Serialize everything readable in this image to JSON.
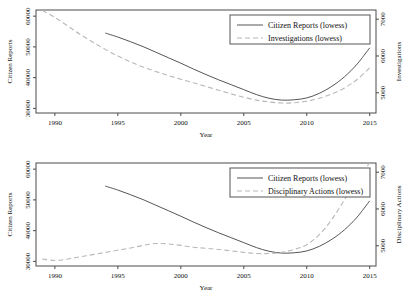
{
  "figure": {
    "background": "#ffffff",
    "solid_color": "#555555",
    "dashed_color": "#b8b8b8",
    "frame_color": "#4a4a4a"
  },
  "chart_data": [
    {
      "type": "line",
      "title": "",
      "panel": "top",
      "xlabel": "Year",
      "ylabel": "Citizen Reports",
      "y2label": "Investigations",
      "xlim": [
        1988.5,
        2015.5
      ],
      "ylim": [
        28500,
        62000
      ],
      "y2lim": [
        4450,
        7250
      ],
      "xticks": [
        1990,
        1995,
        2000,
        2005,
        2010,
        2015
      ],
      "yticks": [
        30000,
        40000,
        50000,
        60000
      ],
      "y2ticks": [
        5000,
        6000,
        7000
      ],
      "grid": false,
      "legend_position": "top-right",
      "series": [
        {
          "name": "Citizen Reports (lowess)",
          "style": "solid",
          "axis": "left",
          "x": [
            1994,
            1995,
            1996,
            1997,
            1998,
            1999,
            2000,
            2001,
            2002,
            2003,
            2004,
            2005,
            2006,
            2007,
            2008,
            2009,
            2010,
            2011,
            2012,
            2013,
            2014,
            2015
          ],
          "values": [
            54500,
            53200,
            51700,
            50100,
            48300,
            46500,
            44700,
            42800,
            41000,
            39300,
            37700,
            36100,
            34500,
            33300,
            32700,
            32800,
            33400,
            34900,
            37200,
            40300,
            44400,
            49700
          ]
        },
        {
          "name": "Investigations (lowess)",
          "style": "dashed",
          "axis": "right",
          "x": [
            1989,
            1990,
            1991,
            1992,
            1993,
            1994,
            1995,
            1996,
            1997,
            1998,
            1999,
            2000,
            2001,
            2002,
            2003,
            2004,
            2005,
            2006,
            2007,
            2008,
            2009,
            2010,
            2011,
            2012,
            2013,
            2014,
            2015
          ],
          "values": [
            7240,
            7050,
            6820,
            6590,
            6380,
            6180,
            6000,
            5840,
            5700,
            5580,
            5470,
            5370,
            5270,
            5170,
            5070,
            4970,
            4880,
            4800,
            4750,
            4720,
            4730,
            4770,
            4850,
            4970,
            5130,
            5360,
            5680
          ]
        }
      ]
    },
    {
      "type": "line",
      "title": "",
      "panel": "bottom",
      "xlabel": "Year",
      "ylabel": "Citizen Reports",
      "y2label": "Disciplinary Actions",
      "xlim": [
        1988.5,
        2015.5
      ],
      "ylim": [
        28500,
        62000
      ],
      "y2lim": [
        4450,
        7250
      ],
      "xticks": [
        1990,
        1995,
        2000,
        2005,
        2010,
        2015
      ],
      "yticks": [
        30000,
        40000,
        50000,
        60000
      ],
      "y2ticks": [
        5000,
        6000,
        7000
      ],
      "grid": false,
      "legend_position": "top-right",
      "series": [
        {
          "name": "Citizen Reports (lowess)",
          "style": "solid",
          "axis": "left",
          "x": [
            1994,
            1995,
            1996,
            1997,
            1998,
            1999,
            2000,
            2001,
            2002,
            2003,
            2004,
            2005,
            2006,
            2007,
            2008,
            2009,
            2010,
            2011,
            2012,
            2013,
            2014,
            2015
          ],
          "values": [
            54500,
            53200,
            51700,
            50100,
            48300,
            46500,
            44700,
            42800,
            41000,
            39300,
            37700,
            36100,
            34500,
            33300,
            32700,
            32800,
            33400,
            34900,
            37200,
            40300,
            44400,
            49700
          ]
        },
        {
          "name": "Disciplinary Actions (lowess)",
          "style": "dashed",
          "axis": "right",
          "x": [
            1989,
            1990,
            1991,
            1992,
            1993,
            1994,
            1995,
            1996,
            1997,
            1998,
            1999,
            2000,
            2001,
            2002,
            2003,
            2004,
            2005,
            2006,
            2007,
            2008,
            2009,
            2010,
            2011,
            2012,
            2013,
            2014,
            2015
          ],
          "values": [
            4640,
            4600,
            4640,
            4700,
            4760,
            4820,
            4880,
            4940,
            5010,
            5060,
            5050,
            5010,
            4960,
            4930,
            4900,
            4860,
            4820,
            4790,
            4790,
            4820,
            4900,
            5030,
            5300,
            5720,
            6250,
            6830,
            7250
          ]
        }
      ]
    }
  ],
  "panels": {
    "top": {
      "ylabel": "Citizen Reports",
      "y2label": "Investigations",
      "xlabel": "Year",
      "legend": [
        {
          "label": "Citizen Reports (lowess)",
          "style": "solid"
        },
        {
          "label": "Investigations (lowess)",
          "style": "dashed"
        }
      ],
      "yticks": [
        "30000",
        "40000",
        "50000",
        "60000"
      ],
      "y2ticks": [
        "5000",
        "6000",
        "7000"
      ],
      "xticks": [
        "1990",
        "1995",
        "2000",
        "2005",
        "2010",
        "2015"
      ]
    },
    "bottom": {
      "ylabel": "Citizen Reports",
      "y2label": "Disciplinary Actions",
      "xlabel": "Year",
      "legend": [
        {
          "label": "Citizen Reports (lowess)",
          "style": "solid"
        },
        {
          "label": "Disciplinary Actions (lowess)",
          "style": "dashed"
        }
      ],
      "yticks": [
        "30000",
        "40000",
        "50000",
        "60000"
      ],
      "y2ticks": [
        "5000",
        "6000",
        "7000"
      ],
      "xticks": [
        "1990",
        "1995",
        "2000",
        "2005",
        "2010",
        "2015"
      ]
    }
  }
}
